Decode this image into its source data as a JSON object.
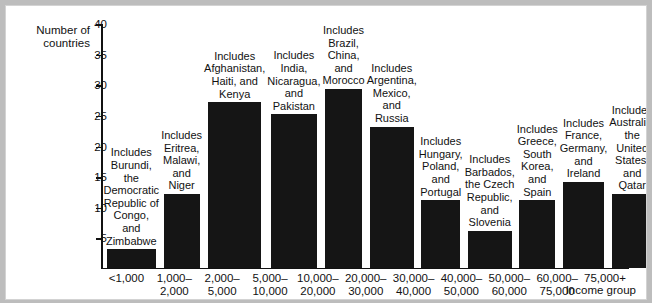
{
  "chart_data": {
    "type": "bar",
    "title": "",
    "ylabel": "Number of\ncountries",
    "xlabel": "Income group",
    "ylim": [
      0,
      40
    ],
    "yticks": [
      40,
      35,
      30,
      25,
      20,
      15,
      10,
      5
    ],
    "grid": false,
    "legend": "none",
    "categories": [
      "<1,000",
      "1,000–\n2,000",
      "2,000–\n5,000",
      "5,000–\n10,000",
      "10,000–\n20,000",
      "20,000–\n30,000",
      "30,000–\n40,000",
      "40,000–\n50,000",
      "50,000–\n60,000",
      "60,000–\n75,000",
      "75,000+"
    ],
    "values": [
      3,
      12,
      27,
      25,
      33,
      23,
      11,
      6,
      11,
      14,
      12
    ],
    "annotations": [
      "Includes\nBurundi, the\nDemocratic\nRepublic of\nCongo, and\nZimbabwe",
      "Includes\nEritrea,\nMalawi,\nand\nNiger",
      "Includes\nAfghanistan,\nHaiti, and\nKenya",
      "Includes\nIndia,\nNicaragua,\nand\nPakistan",
      "Includes\nBrazil,\nChina, and\nMorocco",
      "Includes\nArgentina,\nMexico,\nand Russia",
      "Includes\nHungary,\nPoland,\nand\nPortugal",
      "Includes\nBarbados,\nthe Czech\nRepublic,\nand\nSlovenia",
      "Includes\nGreece,\nSouth\nKorea,\nand\nSpain",
      "Includes\nFrance,\nGermany,\nand\nIreland",
      "Includes\nAustralia,\nthe\nUnited\nStates,\nand Qatar"
    ],
    "colors": {
      "bar": "#151515",
      "axis": "#111111",
      "background": "#ffffff",
      "page": "#bdbdbd"
    }
  }
}
